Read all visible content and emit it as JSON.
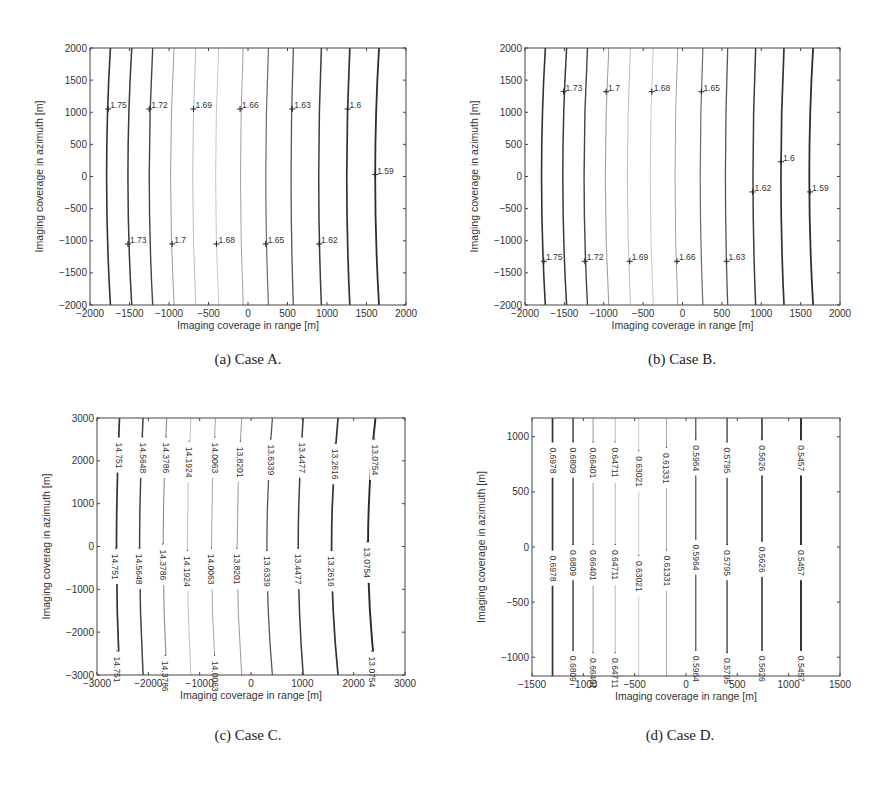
{
  "chart_data": [
    {
      "id": "a",
      "type": "contour",
      "caption": "(a)  Case A.",
      "xlabel": "Imaging coverage in range [m]",
      "ylabel": "Imaging coverage in azimuth [m]",
      "xlim": [
        -2000,
        2000
      ],
      "ylim": [
        -2000,
        2000
      ],
      "xticks": [
        -2000,
        -1500,
        -1000,
        -500,
        0,
        500,
        1000,
        1500,
        2000
      ],
      "yticks": [
        -2000,
        -1500,
        -1000,
        -500,
        0,
        500,
        1000,
        1500,
        2000
      ],
      "box": {
        "x0": 90,
        "y0": 48,
        "x1": 406,
        "y1": 305
      },
      "label_style": "horizontal",
      "contours": [
        {
          "level": 1.75,
          "x_edge": -1740,
          "x_mid": -1790,
          "shade": "#333333",
          "w": 1.6
        },
        {
          "level": 1.73,
          "x_edge": -1470,
          "x_mid": -1520,
          "shade": "#3a3a3a",
          "w": 1.5
        },
        {
          "level": 1.72,
          "x_edge": -1205,
          "x_mid": -1250,
          "shade": "#444444",
          "w": 1.4
        },
        {
          "level": 1.7,
          "x_edge": -935,
          "x_mid": -980,
          "shade": "#9a9a9a",
          "w": 1.0
        },
        {
          "level": 1.69,
          "x_edge": -660,
          "x_mid": -700,
          "shade": "#b4b4b4",
          "w": 0.9
        },
        {
          "level": 1.68,
          "x_edge": -370,
          "x_mid": -410,
          "shade": "#c0c0c0",
          "w": 0.9
        },
        {
          "level": 1.66,
          "x_edge": -60,
          "x_mid": -95,
          "shade": "#a0a0a0",
          "w": 1.0
        },
        {
          "level": 1.65,
          "x_edge": 260,
          "x_mid": 225,
          "shade": "#6a6a6a",
          "w": 1.2
        },
        {
          "level": 1.63,
          "x_edge": 575,
          "x_mid": 545,
          "shade": "#555555",
          "w": 1.3
        },
        {
          "level": 1.62,
          "x_edge": 930,
          "x_mid": 895,
          "shade": "#3c3c3c",
          "w": 1.5
        },
        {
          "level": 1.6,
          "x_edge": 1290,
          "x_mid": 1250,
          "shade": "#333333",
          "w": 1.7
        },
        {
          "level": 1.59,
          "x_edge": 1660,
          "x_mid": 1610,
          "shade": "#2e2e2e",
          "w": 1.8
        }
      ],
      "labels": [
        {
          "text": "1.75",
          "x": -1770,
          "y": 1050
        },
        {
          "text": "1.72",
          "x": -1250,
          "y": 1050
        },
        {
          "text": "1.69",
          "x": -690,
          "y": 1050
        },
        {
          "text": "1.66",
          "x": -100,
          "y": 1050
        },
        {
          "text": "1.63",
          "x": 560,
          "y": 1050
        },
        {
          "text": "1.6",
          "x": 1260,
          "y": 1050
        },
        {
          "text": "1.59",
          "x": 1610,
          "y": 30
        },
        {
          "text": "1.73",
          "x": -1520,
          "y": -1050
        },
        {
          "text": "1.7",
          "x": -960,
          "y": -1050
        },
        {
          "text": "1.68",
          "x": -400,
          "y": -1050
        },
        {
          "text": "1.65",
          "x": 225,
          "y": -1050
        },
        {
          "text": "1.62",
          "x": 900,
          "y": -1050
        }
      ]
    },
    {
      "id": "b",
      "type": "contour",
      "caption": "(b)  Case B.",
      "xlabel": "Imaging coverage in range [m]",
      "ylabel": "Imaging coverage in azimuth [m]",
      "xlim": [
        -2000,
        2000
      ],
      "ylim": [
        -2000,
        2000
      ],
      "xticks": [
        -2000,
        -1500,
        -1000,
        -500,
        0,
        500,
        1000,
        1500,
        2000
      ],
      "yticks": [
        -2000,
        -1500,
        -1000,
        -500,
        0,
        500,
        1000,
        1500,
        2000
      ],
      "box": {
        "x0": 525,
        "y0": 48,
        "x1": 840,
        "y1": 305
      },
      "label_style": "horizontal",
      "contours": [
        {
          "level": 1.75,
          "x_edge": -1740,
          "x_mid": -1790,
          "shade": "#333333",
          "w": 1.6
        },
        {
          "level": 1.73,
          "x_edge": -1470,
          "x_mid": -1520,
          "shade": "#3a3a3a",
          "w": 1.5
        },
        {
          "level": 1.72,
          "x_edge": -1205,
          "x_mid": -1250,
          "shade": "#444444",
          "w": 1.4
        },
        {
          "level": 1.7,
          "x_edge": -935,
          "x_mid": -980,
          "shade": "#9a9a9a",
          "w": 1.0
        },
        {
          "level": 1.69,
          "x_edge": -660,
          "x_mid": -700,
          "shade": "#b4b4b4",
          "w": 0.9
        },
        {
          "level": 1.68,
          "x_edge": -370,
          "x_mid": -410,
          "shade": "#c0c0c0",
          "w": 0.9
        },
        {
          "level": 1.66,
          "x_edge": -60,
          "x_mid": -95,
          "shade": "#a0a0a0",
          "w": 1.0
        },
        {
          "level": 1.65,
          "x_edge": 260,
          "x_mid": 225,
          "shade": "#6a6a6a",
          "w": 1.2
        },
        {
          "level": 1.63,
          "x_edge": 575,
          "x_mid": 545,
          "shade": "#555555",
          "w": 1.3
        },
        {
          "level": 1.62,
          "x_edge": 930,
          "x_mid": 895,
          "shade": "#3c3c3c",
          "w": 1.5
        },
        {
          "level": 1.6,
          "x_edge": 1290,
          "x_mid": 1250,
          "shade": "#333333",
          "w": 1.7
        },
        {
          "level": 1.59,
          "x_edge": 1660,
          "x_mid": 1610,
          "shade": "#2e2e2e",
          "w": 1.8
        }
      ],
      "labels": [
        {
          "text": "1.73",
          "x": -1510,
          "y": 1320
        },
        {
          "text": "1.7",
          "x": -970,
          "y": 1320
        },
        {
          "text": "1.68",
          "x": -390,
          "y": 1320
        },
        {
          "text": "1.65",
          "x": 240,
          "y": 1320
        },
        {
          "text": "1.6",
          "x": 1250,
          "y": 230
        },
        {
          "text": "1.62",
          "x": 890,
          "y": -240
        },
        {
          "text": "1.59",
          "x": 1620,
          "y": -240
        },
        {
          "text": "1.75",
          "x": -1760,
          "y": -1320
        },
        {
          "text": "1.72",
          "x": -1240,
          "y": -1320
        },
        {
          "text": "1.69",
          "x": -670,
          "y": -1320
        },
        {
          "text": "1.66",
          "x": -70,
          "y": -1320
        },
        {
          "text": "1.63",
          "x": 560,
          "y": -1320
        }
      ]
    },
    {
      "id": "c",
      "type": "contour",
      "caption": "(c)  Case C.",
      "xlabel": "Imaging coverage in range [m]",
      "ylabel": "Imaging coverag in azimuth [m]",
      "xlim": [
        -3000,
        3000
      ],
      "ylim": [
        -3000,
        3000
      ],
      "xticks": [
        -3000,
        -2000,
        -1000,
        0,
        1000,
        2000,
        3000
      ],
      "yticks": [
        -3000,
        -2000,
        -1000,
        0,
        1000,
        2000,
        3000
      ],
      "box": {
        "x0": 97,
        "y0": 418,
        "x1": 405,
        "y1": 675
      },
      "label_style": "vertical",
      "contours": [
        {
          "level": 14.751,
          "x_edge": -2560,
          "x_mid": -2620,
          "shade": "#333333",
          "w": 1.7
        },
        {
          "level": 14.5648,
          "x_edge": -2100,
          "x_mid": -2170,
          "shade": "#444444",
          "w": 1.5
        },
        {
          "level": 14.3786,
          "x_edge": -1640,
          "x_mid": -1710,
          "shade": "#8a8a8a",
          "w": 1.1
        },
        {
          "level": 14.1924,
          "x_edge": -1170,
          "x_mid": -1240,
          "shade": "#b8b8b8",
          "w": 0.9
        },
        {
          "level": 14.0063,
          "x_edge": -690,
          "x_mid": -770,
          "shade": "#a5a5a5",
          "w": 1.0
        },
        {
          "level": 13.8201,
          "x_edge": -180,
          "x_mid": -270,
          "shade": "#9a9a9a",
          "w": 1.0
        },
        {
          "level": 13.6339,
          "x_edge": 420,
          "x_mid": 310,
          "shade": "#555555",
          "w": 1.3
        },
        {
          "level": 13.4477,
          "x_edge": 1020,
          "x_mid": 920,
          "shade": "#3e3e3e",
          "w": 1.5
        },
        {
          "level": 13.2616,
          "x_edge": 1700,
          "x_mid": 1570,
          "shade": "#333333",
          "w": 1.7
        },
        {
          "level": 13.0754,
          "x_edge": 2430,
          "x_mid": 2280,
          "shade": "#2a2a2a",
          "w": 1.9
        }
      ],
      "labels": [
        {
          "text": "14.751",
          "x": -2570,
          "y": 2500
        },
        {
          "text": "14.5648",
          "x": -2110,
          "y": 2500
        },
        {
          "text": "14.3786",
          "x": -1650,
          "y": 2500
        },
        {
          "text": "14.1924",
          "x": -1210,
          "y": 2400
        },
        {
          "text": "14.0063",
          "x": -700,
          "y": 2500
        },
        {
          "text": "13.8201",
          "x": -210,
          "y": 2400
        },
        {
          "text": "13.6339",
          "x": 380,
          "y": 2450
        },
        {
          "text": "13.4477",
          "x": 990,
          "y": 2500
        },
        {
          "text": "13.2616",
          "x": 1640,
          "y": 2350
        },
        {
          "text": "13.0754",
          "x": 2410,
          "y": 2450
        },
        {
          "text": "14.751",
          "x": -2640,
          "y": -100
        },
        {
          "text": "14.5648",
          "x": -2180,
          "y": -100
        },
        {
          "text": "14.3786",
          "x": -1720,
          "y": 0
        },
        {
          "text": "14.1924",
          "x": -1240,
          "y": -150
        },
        {
          "text": "14.0063",
          "x": -770,
          "y": -100
        },
        {
          "text": "13.8201",
          "x": -280,
          "y": -100
        },
        {
          "text": "13.6339",
          "x": 310,
          "y": -150
        },
        {
          "text": "13.4477",
          "x": 910,
          "y": -100
        },
        {
          "text": "13.2616",
          "x": 1560,
          "y": -150
        },
        {
          "text": "13.0754",
          "x": 2260,
          "y": 50
        },
        {
          "text": "14.751",
          "x": -2610,
          "y": -2500
        },
        {
          "text": "14.3786",
          "x": -1670,
          "y": -2600
        },
        {
          "text": "14.0063",
          "x": -710,
          "y": -2600
        },
        {
          "text": "13.0754",
          "x": 2350,
          "y": -2500
        }
      ]
    },
    {
      "id": "d",
      "type": "contour",
      "caption": "(d)  Case D.",
      "xlabel": "Imaging coverage in range [m]",
      "ylabel": "Imaging coverage in azimuth [m]",
      "xlim": [
        -1500,
        1500
      ],
      "ylim": [
        -1170,
        1170
      ],
      "xticks": [
        -1500,
        -1000,
        -500,
        0,
        500,
        1000,
        1500
      ],
      "yticks": [
        -1000,
        -500,
        0,
        500,
        1000
      ],
      "box": {
        "x0": 532,
        "y0": 418,
        "x1": 840,
        "y1": 676
      },
      "label_style": "vertical",
      "contours": [
        {
          "level": 0.6978,
          "x_edge": -1300,
          "x_mid": -1300,
          "shade": "#333333",
          "w": 1.7
        },
        {
          "level": 0.6809,
          "x_edge": -1100,
          "x_mid": -1100,
          "shade": "#444444",
          "w": 1.5
        },
        {
          "level": 0.66401,
          "x_edge": -905,
          "x_mid": -905,
          "shade": "#999999",
          "w": 1.0
        },
        {
          "level": 0.64711,
          "x_edge": -690,
          "x_mid": -690,
          "shade": "#b0b0b0",
          "w": 0.9
        },
        {
          "level": 0.63021,
          "x_edge": -460,
          "x_mid": -460,
          "shade": "#c4c4c4",
          "w": 0.9
        },
        {
          "level": 0.61331,
          "x_edge": -190,
          "x_mid": -190,
          "shade": "#aaaaaa",
          "w": 1.0
        },
        {
          "level": 0.5964,
          "x_edge": 95,
          "x_mid": 95,
          "shade": "#555555",
          "w": 1.3
        },
        {
          "level": 0.5795,
          "x_edge": 400,
          "x_mid": 400,
          "shade": "#444444",
          "w": 1.4
        },
        {
          "level": 0.5626,
          "x_edge": 740,
          "x_mid": 740,
          "shade": "#363636",
          "w": 1.6
        },
        {
          "level": 0.5457,
          "x_edge": 1120,
          "x_mid": 1120,
          "shade": "#2a2a2a",
          "w": 1.9
        }
      ],
      "labels": [
        {
          "text": "0.6978",
          "x": -1300,
          "y": 930
        },
        {
          "text": "0.6809",
          "x": -1100,
          "y": 930
        },
        {
          "text": "0.66401",
          "x": -905,
          "y": 930
        },
        {
          "text": "0.64711",
          "x": -690,
          "y": 930
        },
        {
          "text": "0.63021",
          "x": -460,
          "y": 850
        },
        {
          "text": "0.61331",
          "x": -190,
          "y": 880
        },
        {
          "text": "0.5964",
          "x": 95,
          "y": 950
        },
        {
          "text": "0.5795",
          "x": 400,
          "y": 930
        },
        {
          "text": "0.5626",
          "x": 740,
          "y": 950
        },
        {
          "text": "0.5457",
          "x": 1120,
          "y": 950
        },
        {
          "text": "0.6978",
          "x": -1300,
          "y": -50
        },
        {
          "text": "0.6809",
          "x": -1100,
          "y": 0
        },
        {
          "text": "0.66401",
          "x": -905,
          "y": 0
        },
        {
          "text": "0.64711",
          "x": -690,
          "y": 0
        },
        {
          "text": "0.63021",
          "x": -460,
          "y": -100
        },
        {
          "text": "0.61331",
          "x": -190,
          "y": -50
        },
        {
          "text": "0.5964",
          "x": 95,
          "y": 50
        },
        {
          "text": "0.5795",
          "x": 400,
          "y": 0
        },
        {
          "text": "0.5626",
          "x": 740,
          "y": 30
        },
        {
          "text": "0.5457",
          "x": 1120,
          "y": 0
        },
        {
          "text": "0.6809",
          "x": -1100,
          "y": -960
        },
        {
          "text": "0.66401",
          "x": -905,
          "y": -980
        },
        {
          "text": "0.64711",
          "x": -690,
          "y": -980
        },
        {
          "text": "0.5964",
          "x": 95,
          "y": -960
        },
        {
          "text": "0.5795",
          "x": 400,
          "y": -980
        },
        {
          "text": "0.5626",
          "x": 740,
          "y": -960
        },
        {
          "text": "0.5457",
          "x": 1120,
          "y": -960
        }
      ]
    }
  ]
}
